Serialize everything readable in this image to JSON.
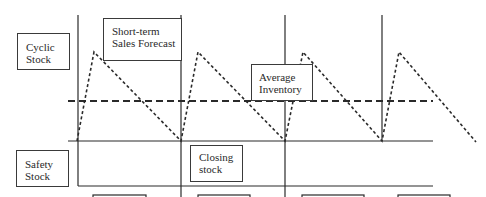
{
  "diagram": {
    "line_color": "#2a2a2a",
    "labels": {
      "cyclic_stock": [
        "Cyclic",
        "Stock"
      ],
      "short_term_forecast": [
        "Short-term",
        "Sales Forecast"
      ],
      "average_inventory": [
        "Average",
        "Inventory"
      ],
      "safety_stock": [
        "Safety",
        "Stock"
      ],
      "closing_stock": [
        "Closing",
        "stock"
      ]
    },
    "bottom_boxes": 4
  }
}
